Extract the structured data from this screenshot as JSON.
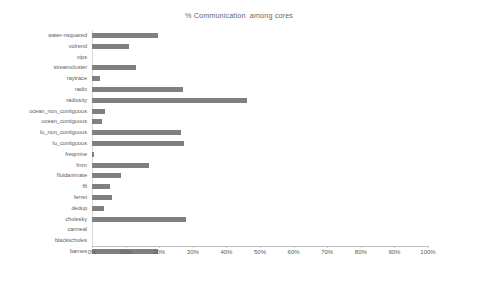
{
  "chart_data": {
    "type": "bar",
    "orientation": "horizontal",
    "title": "% Communication  among cores",
    "xlabel": "",
    "ylabel": "",
    "xlim": [
      0,
      100
    ],
    "xticks": [
      "0%",
      "10%",
      "20%",
      "30%",
      "40%",
      "50%",
      "60%",
      "70%",
      "80%",
      "90%",
      "100%"
    ],
    "xtick_values": [
      0,
      10,
      20,
      30,
      40,
      50,
      60,
      70,
      80,
      90,
      100
    ],
    "grid": false,
    "legend": null,
    "bar_color": "#808080",
    "categories": [
      "water-nsquared",
      "volrend",
      "vips",
      "streamcluster",
      "raytrace",
      "radix",
      "radiosity",
      "ocean_non_contiguous",
      "ocean_contiguous",
      "lu_non_contiguous",
      "lu_contiguous",
      "freqmine",
      "fmm",
      "fluidanimate",
      "fft",
      "ferret",
      "dedup",
      "cholesky",
      "canneal",
      "blackscholes",
      "barnes"
    ],
    "values": [
      19.5,
      11,
      0,
      13,
      2.5,
      27,
      46,
      4,
      3,
      26.5,
      27.5,
      0.7,
      17,
      8.5,
      5.5,
      6,
      3.5,
      28,
      0,
      0,
      19.5
    ]
  }
}
